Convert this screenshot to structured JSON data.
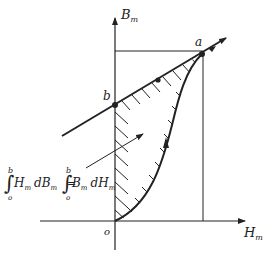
{
  "diagram": {
    "type": "B-H demagnetization diagram",
    "colors": {
      "ink": "#222222",
      "background": "#ffffff"
    },
    "axes": {
      "y_label": "B",
      "y_label_sub": "m",
      "x_label": "H",
      "x_label_sub": "m",
      "origin_label": "o"
    },
    "points": {
      "a": "a",
      "b": "b"
    },
    "equation": {
      "lhs_upper": "b",
      "lhs_lower": "o",
      "lhs_integrand": "H",
      "lhs_integrand_sub": "m",
      "lhs_d": "dB",
      "lhs_d_sub": "m",
      "equals": "=",
      "rhs_upper": "b",
      "rhs_lower": "o",
      "rhs_integrand": "B",
      "rhs_integrand_sub": "m",
      "rhs_d": "dH",
      "rhs_d_sub": "m"
    }
  }
}
